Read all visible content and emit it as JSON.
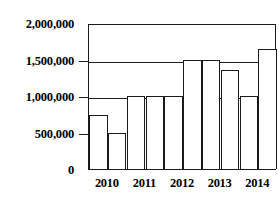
{
  "chart_data": {
    "type": "bar",
    "title": "",
    "subtitle": "",
    "xlabel": "",
    "ylabel": "",
    "categories": [
      "2010",
      "2011",
      "2012",
      "2013",
      "2014"
    ],
    "ylim": [
      0,
      2000000
    ],
    "ytick_values": [
      0,
      500000,
      1000000,
      1500000,
      2000000
    ],
    "ytick_labels": [
      "0",
      "500,000",
      "1,000,000",
      "1,500,000",
      "2,000,000"
    ],
    "grid": "horizontal",
    "legend": "none",
    "series": [
      {
        "name": "Series 1",
        "values": [
          735000,
          1000000,
          1000000,
          1500000,
          1000000
        ]
      },
      {
        "name": "Series 2",
        "values": [
          500000,
          1000000,
          1500000,
          1350000,
          1650000
        ]
      }
    ],
    "bars": [
      {
        "category": "2010",
        "series": "Series 1",
        "value": 735000
      },
      {
        "category": "2010",
        "series": "Series 2",
        "value": 500000
      },
      {
        "category": "2011",
        "series": "Series 1",
        "value": 1000000
      },
      {
        "category": "2011",
        "series": "Series 2",
        "value": 1000000
      },
      {
        "category": "2012",
        "series": "Series 1",
        "value": 1000000
      },
      {
        "category": "2012",
        "series": "Series 2",
        "value": 1500000
      },
      {
        "category": "2013",
        "series": "Series 1",
        "value": 1500000
      },
      {
        "category": "2013",
        "series": "Series 2",
        "value": 1350000
      },
      {
        "category": "2014",
        "series": "Series 1",
        "value": 1000000
      },
      {
        "category": "2014",
        "series": "Series 2",
        "value": 1650000
      }
    ],
    "colors": {
      "bar_fill": "#ffffff",
      "bar_stroke": "#1a1a1a",
      "axis": "#1a1a1a",
      "grid": "#1a1a1a",
      "text": "#000000",
      "background": "#ffffff"
    }
  },
  "axis": {
    "y_labels": [
      {
        "text": "2,000,000",
        "value": 2000000
      },
      {
        "text": "1,500,000",
        "value": 1500000
      },
      {
        "text": "1,000,000",
        "value": 1000000
      },
      {
        "text": "500,000",
        "value": 500000
      },
      {
        "text": "0",
        "value": 0
      }
    ],
    "x_labels": [
      "2010",
      "2011",
      "2012",
      "2013",
      "2014"
    ]
  }
}
